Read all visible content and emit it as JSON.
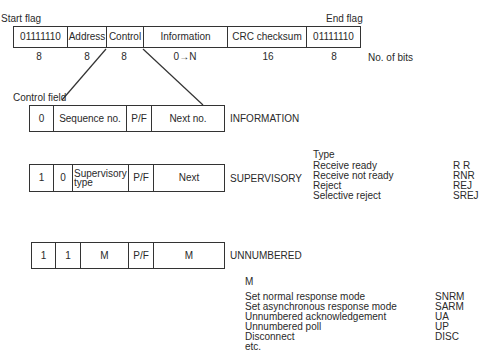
{
  "frame": {
    "start_flag_label": "Start flag",
    "end_flag_label": "End flag",
    "fields": [
      {
        "label": "01111110",
        "bits": "8"
      },
      {
        "label": "Address",
        "bits": "8"
      },
      {
        "label": "Control",
        "bits": "8"
      },
      {
        "label": "Information",
        "bits": "0→N"
      },
      {
        "label": "CRC checksum",
        "bits": "16"
      },
      {
        "label": "01111110",
        "bits": "8"
      }
    ],
    "bits_label": "No. of bits"
  },
  "control_field_label": "Control field",
  "formats": {
    "information": {
      "name": "INFORMATION",
      "cells": [
        "0",
        "Sequence no.",
        "P/F",
        "Next no."
      ]
    },
    "supervisory": {
      "name": "SUPERVISORY",
      "cells": [
        "1",
        "0",
        "Supervisory type",
        "P/F",
        "Next"
      ]
    },
    "unnumbered": {
      "name": "UNNUMBERED",
      "cells": [
        "1",
        "1",
        "M",
        "P/F",
        "M"
      ]
    }
  },
  "supervisory_types": {
    "heading": "Type",
    "rows": [
      {
        "name": "Receive ready",
        "code": "R R"
      },
      {
        "name": "Receive not ready",
        "code": "RNR"
      },
      {
        "name": "Reject",
        "code": "REJ"
      },
      {
        "name": "Selective reject",
        "code": "SREJ"
      }
    ]
  },
  "unnumbered_types": {
    "heading": "M",
    "rows": [
      {
        "name": "Set normal response mode",
        "code": "SNRM"
      },
      {
        "name": "Set asynchronous response mode",
        "code": "SARM"
      },
      {
        "name": "Unnumbered acknowledgement",
        "code": "UA"
      },
      {
        "name": "Unnumbered poll",
        "code": "UP"
      },
      {
        "name": "Disconnect",
        "code": "DISC"
      },
      {
        "name": "etc.",
        "code": ""
      }
    ]
  }
}
